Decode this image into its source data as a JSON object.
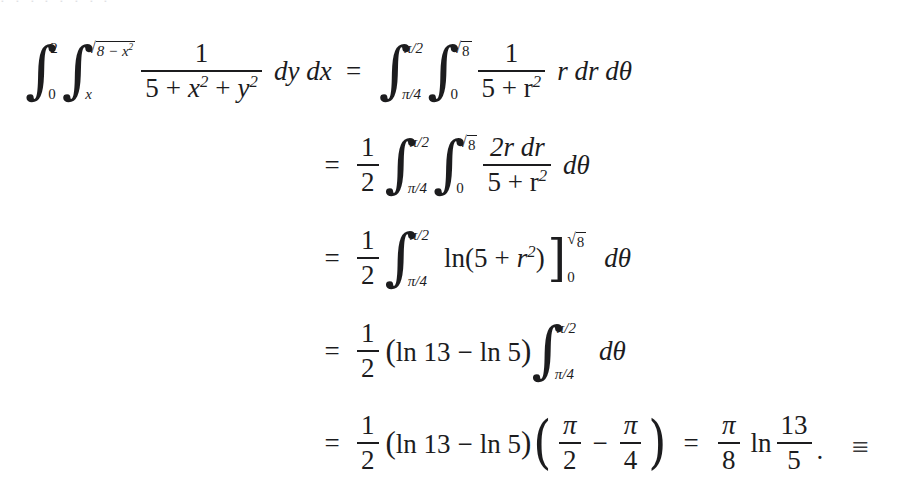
{
  "document": {
    "type": "mathematical-derivation",
    "background_color": "#ffffff",
    "text_color": "#1c1c1e",
    "description": "Worked textbook example converting a double integral from rectangular to polar coordinates",
    "clipped_text_above": "‧ ‧ ‧ ‧ ‧ ‧ ‧ ‧"
  },
  "equation": {
    "lhs": {
      "outer_integral": {
        "lower": "0",
        "upper": "2"
      },
      "inner_integral": {
        "lower": "x",
        "upper_radicand": "8 − x",
        "upper_exponent": "2"
      },
      "integrand": {
        "numerator": "1",
        "denominator_parts": [
          "5",
          "+",
          "x",
          "+",
          "y"
        ],
        "denominator_display": "5 + x² + y²"
      },
      "differentials": "dy dx"
    },
    "relation": "=",
    "lines": [
      {
        "id": "line-1-rhs",
        "equals": "=",
        "outer_integral": {
          "lower": "π/4",
          "upper": "π/2"
        },
        "inner_integral": {
          "lower": "0",
          "upper_radicand": "8"
        },
        "fraction": {
          "numerator": "1",
          "denominator": "5 + r²"
        },
        "trailing": "r dr dθ"
      },
      {
        "id": "line-2",
        "equals": "=",
        "coefficient": {
          "numerator": "1",
          "denominator": "2"
        },
        "outer_integral": {
          "lower": "π/4",
          "upper": "π/2"
        },
        "inner_integral": {
          "lower": "0",
          "upper_radicand": "8"
        },
        "fraction": {
          "numerator": "2r dr",
          "denominator": "5 + r²"
        },
        "trailing": "dθ"
      },
      {
        "id": "line-3",
        "equals": "=",
        "coefficient": {
          "numerator": "1",
          "denominator": "2"
        },
        "integral": {
          "lower": "π/4",
          "upper": "π/2"
        },
        "expression": "ln(5 + r²)",
        "eval_bracket": {
          "lower": "0",
          "upper_radicand": "8"
        },
        "trailing": "dθ"
      },
      {
        "id": "line-4",
        "equals": "=",
        "coefficient": {
          "numerator": "1",
          "denominator": "2"
        },
        "expression": "(ln 13 − ln 5)",
        "integral": {
          "lower": "π/4",
          "upper": "π/2"
        },
        "trailing": "dθ"
      },
      {
        "id": "line-5",
        "equals": "=",
        "coefficient": {
          "numerator": "1",
          "denominator": "2"
        },
        "expression": "(ln 13 − ln 5)",
        "paren_group": {
          "first": {
            "numerator": "π",
            "denominator": "2"
          },
          "operator": "−",
          "second": {
            "numerator": "π",
            "denominator": "4"
          }
        },
        "result_equals": "=",
        "result": {
          "coefficient": {
            "numerator": "π",
            "denominator": "8"
          },
          "log": "ln",
          "argument": {
            "numerator": "13",
            "denominator": "5"
          },
          "period": "."
        }
      }
    ]
  },
  "symbols": {
    "integral": "∫",
    "radical": "√",
    "minus": "−",
    "plus": "+",
    "equals": "=",
    "pi": "π",
    "theta": "θ",
    "left_paren": "(",
    "right_paren": ")",
    "right_bracket": "]",
    "end_of_proof": "≡"
  },
  "tokens": {
    "one": "1",
    "two": "2",
    "five": "5",
    "eight": "8",
    "thirteen": "13",
    "zero": "0",
    "x": "x",
    "y": "y",
    "r": "r",
    "exp2": "2",
    "ln": "ln",
    "dy_dx": "dy dx",
    "r_dr_dtheta": "r dr dθ",
    "d_theta": "dθ",
    "two_r_dr": "2r dr",
    "five_plus_r2": "5 + r",
    "pi_over_2": "π/2",
    "pi_over_4": "π/4",
    "eight_minus_x2": "8 − x",
    "ln13": "ln 13",
    "ln5": "ln 5"
  }
}
